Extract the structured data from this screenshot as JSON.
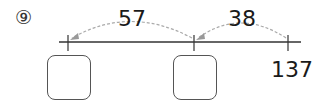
{
  "problem": {
    "number_label": "⑨",
    "jump1_label": "57",
    "jump2_label": "38",
    "end_value": "137",
    "box1_value": "",
    "box2_value": ""
  },
  "colors": {
    "line": "#333333",
    "arc": "#aaaaaa",
    "text": "#1a1a1a"
  }
}
